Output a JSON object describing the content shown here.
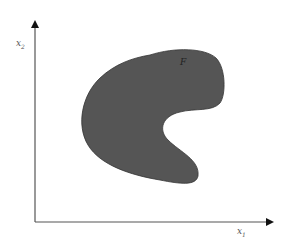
{
  "diagram": {
    "axes": {
      "x_label": "x",
      "x_subscript": "1",
      "y_label": "x",
      "y_subscript": "2"
    },
    "region": {
      "label": "F",
      "fill_color": "#555555",
      "description": "kidney-shaped (non-convex) region"
    },
    "axis_color": "#333333"
  }
}
